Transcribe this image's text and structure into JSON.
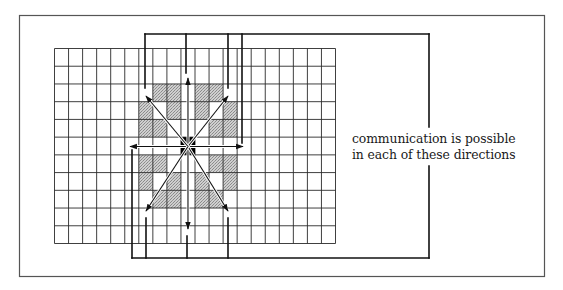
{
  "figure": {
    "grid": {
      "columns": 20,
      "rows": 11,
      "center_cell": {
        "col": 9,
        "row": 5
      },
      "shaded_cells": [
        {
          "col": 7,
          "row": 2
        },
        {
          "col": 8,
          "row": 2
        },
        {
          "col": 10,
          "row": 2
        },
        {
          "col": 11,
          "row": 2
        },
        {
          "col": 6,
          "row": 3
        },
        {
          "col": 8,
          "row": 3
        },
        {
          "col": 10,
          "row": 3
        },
        {
          "col": 12,
          "row": 3
        },
        {
          "col": 6,
          "row": 4
        },
        {
          "col": 7,
          "row": 4
        },
        {
          "col": 11,
          "row": 4
        },
        {
          "col": 12,
          "row": 4
        },
        {
          "col": 6,
          "row": 6
        },
        {
          "col": 7,
          "row": 6
        },
        {
          "col": 11,
          "row": 6
        },
        {
          "col": 12,
          "row": 6
        },
        {
          "col": 6,
          "row": 7
        },
        {
          "col": 8,
          "row": 7
        },
        {
          "col": 10,
          "row": 7
        },
        {
          "col": 12,
          "row": 7
        },
        {
          "col": 7,
          "row": 8
        },
        {
          "col": 8,
          "row": 8
        },
        {
          "col": 10,
          "row": 8
        },
        {
          "col": 11,
          "row": 8
        }
      ]
    },
    "directions": [
      "north",
      "south",
      "east",
      "west",
      "north-east",
      "north-west",
      "south-east",
      "south-west"
    ],
    "caption": {
      "line1": "communication is possible",
      "line2": "in each of these directions"
    },
    "colors": {
      "frame": "#555555",
      "grid_line": "#2a2a2a",
      "shade": "#bdbdbd",
      "center": "#000000",
      "arrow": "#111111",
      "bracket": "#111111"
    }
  }
}
